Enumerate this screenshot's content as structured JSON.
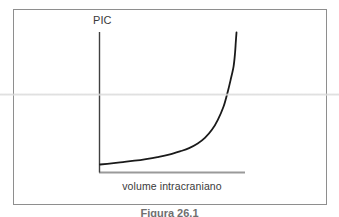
{
  "figure": {
    "caption": "Figura 26.1",
    "frame_color": "#8e8e8e",
    "background": "#ffffff"
  },
  "chart_data": {
    "type": "line",
    "title": "",
    "subtitle": "",
    "xlabel": "volume intracraniano",
    "ylabel": "PIC",
    "grid": false,
    "legend": null,
    "axis_style": {
      "y_axis_color": "#404040",
      "x_axis_color": "#9a9a9a",
      "curve_color": "#1a1a1a",
      "curve_width_px": 1.8
    },
    "xlim": [
      0,
      1
    ],
    "ylim": [
      0,
      1
    ],
    "x_tick_labels": [],
    "y_tick_labels": [],
    "annotations": [],
    "series": [
      {
        "name": "curva pressao-volume",
        "x": [
          0.0,
          0.08,
          0.16,
          0.24,
          0.32,
          0.4,
          0.48,
          0.56,
          0.62,
          0.68,
          0.73,
          0.78,
          0.82,
          0.86,
          0.89,
          0.91,
          0.93,
          0.94,
          0.945,
          0.95
        ],
        "y": [
          0.055,
          0.063,
          0.072,
          0.082,
          0.094,
          0.108,
          0.125,
          0.15,
          0.172,
          0.205,
          0.245,
          0.305,
          0.375,
          0.47,
          0.58,
          0.665,
          0.76,
          0.855,
          0.93,
          1.0
        ]
      }
    ]
  }
}
